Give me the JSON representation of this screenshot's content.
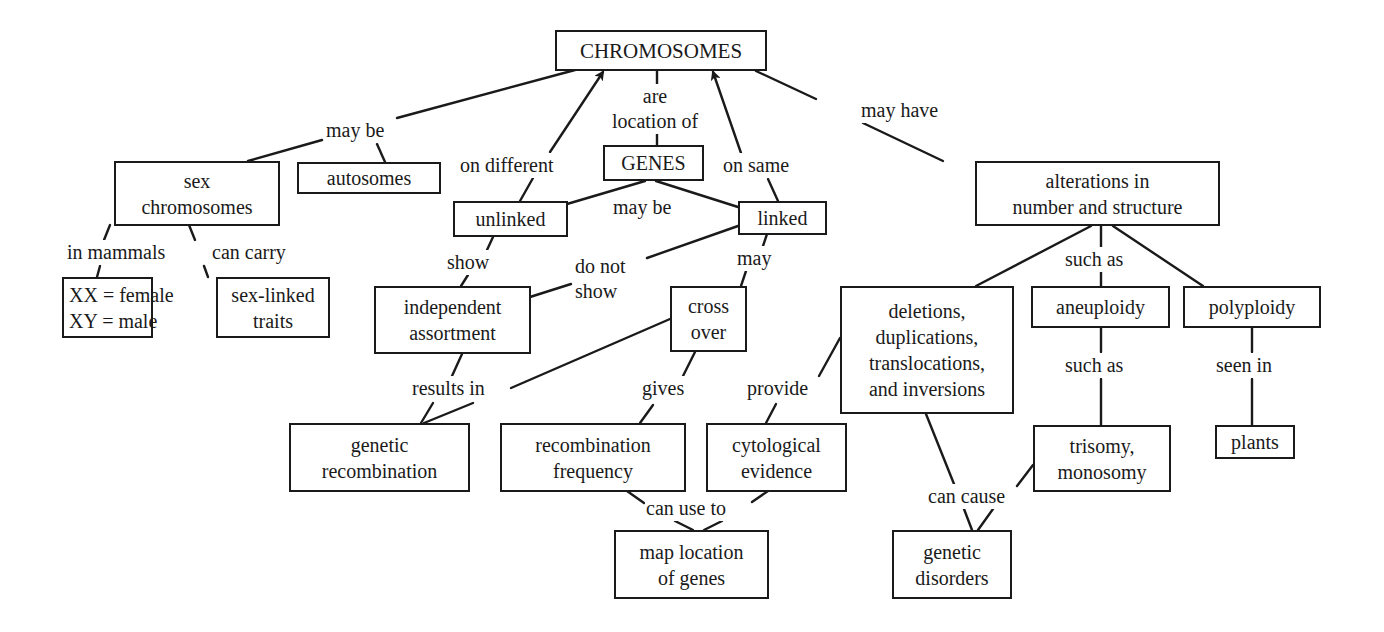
{
  "diagram": {
    "type": "concept-map",
    "root": "CHROMOSOMES",
    "colors": {
      "ink": "#1a1a1a",
      "background": "#ffffff"
    }
  },
  "nodes": {
    "chromosomes": [
      "CHROMOSOMES"
    ],
    "sex_chromosomes": [
      "sex",
      "chromosomes"
    ],
    "autosomes": [
      "autosomes"
    ],
    "xx_xy": [
      "XX = female",
      "XY = male"
    ],
    "sex_linked": [
      "sex-linked",
      "traits"
    ],
    "genes": [
      "GENES"
    ],
    "unlinked": [
      "unlinked"
    ],
    "linked": [
      "linked"
    ],
    "independent": [
      "independent",
      "assortment"
    ],
    "cross_over": [
      "cross",
      "over"
    ],
    "genetic_recombination": [
      "genetic",
      "recombination"
    ],
    "recombination_frequency": [
      "recombination",
      "frequency"
    ],
    "cytological": [
      "cytological",
      "evidence"
    ],
    "map_location": [
      "map location",
      "of genes"
    ],
    "alterations": [
      "alterations in",
      "number and structure"
    ],
    "deletions": [
      "deletions,",
      "duplications,",
      "translocations,",
      "and inversions"
    ],
    "aneuploidy": [
      "aneuploidy"
    ],
    "polyploidy": [
      "polyploidy"
    ],
    "trisomy": [
      "trisomy,",
      "monosomy"
    ],
    "plants": [
      "plants"
    ],
    "genetic_disorders": [
      "genetic",
      "disorders"
    ]
  },
  "labels": {
    "may_be_1": [
      "may be"
    ],
    "are_location_of": [
      "are",
      "location of"
    ],
    "on_different": [
      "on different"
    ],
    "on_same": [
      "on same"
    ],
    "may_have": [
      "may have"
    ],
    "in_mammals": [
      "in mammals"
    ],
    "can_carry": [
      "can carry"
    ],
    "may_be_2": [
      "may be"
    ],
    "show": [
      "show"
    ],
    "do_not_show": [
      "do not",
      "show"
    ],
    "may": [
      "may"
    ],
    "results_in": [
      "results in"
    ],
    "gives": [
      "gives"
    ],
    "provide": [
      "provide"
    ],
    "can_use_to": [
      "can use to"
    ],
    "such_as_1": [
      "such as"
    ],
    "such_as_2": [
      "such as"
    ],
    "seen_in": [
      "seen in"
    ],
    "can_cause": [
      "can cause"
    ]
  },
  "edges": [
    {
      "from": "CHROMOSOMES",
      "label": "may be",
      "to": [
        "sex chromosomes",
        "autosomes"
      ]
    },
    {
      "from": "CHROMOSOMES",
      "label": "are location of",
      "to": [
        "GENES"
      ]
    },
    {
      "from": "unlinked",
      "label": "on different",
      "to": [
        "CHROMOSOMES"
      ],
      "arrow": true
    },
    {
      "from": "linked",
      "label": "on same",
      "to": [
        "CHROMOSOMES"
      ],
      "arrow": true
    },
    {
      "from": "CHROMOSOMES",
      "label": "may have",
      "to": [
        "alterations in number and structure"
      ]
    },
    {
      "from": "sex chromosomes",
      "label": "in mammals",
      "to": [
        "XX = female, XY = male"
      ]
    },
    {
      "from": "sex chromosomes",
      "label": "can carry",
      "to": [
        "sex-linked traits"
      ]
    },
    {
      "from": "GENES",
      "label": "may be",
      "to": [
        "unlinked",
        "linked"
      ]
    },
    {
      "from": "unlinked",
      "label": "show",
      "to": [
        "independent assortment"
      ]
    },
    {
      "from": "linked",
      "label": "do not show",
      "to": [
        "independent assortment"
      ]
    },
    {
      "from": "linked",
      "label": "may",
      "to": [
        "cross over"
      ]
    },
    {
      "from": "independent assortment",
      "label": "results in",
      "to": [
        "genetic recombination"
      ]
    },
    {
      "from": "cross over",
      "label": "results in",
      "to": [
        "genetic recombination"
      ]
    },
    {
      "from": "cross over",
      "label": "gives",
      "to": [
        "recombination frequency"
      ]
    },
    {
      "from": "deletions, duplications, translocations, and inversions",
      "label": "provide",
      "to": [
        "cytological evidence"
      ]
    },
    {
      "from": "recombination frequency",
      "label": "can use to",
      "to": [
        "map location of genes"
      ]
    },
    {
      "from": "cytological evidence",
      "label": "can use to",
      "to": [
        "map location of genes"
      ]
    },
    {
      "from": "alterations in number and structure",
      "label": "such as",
      "to": [
        "deletions, duplications, translocations, and inversions",
        "aneuploidy",
        "polyploidy"
      ]
    },
    {
      "from": "aneuploidy",
      "label": "such as",
      "to": [
        "trisomy, monosomy"
      ]
    },
    {
      "from": "polyploidy",
      "label": "seen in",
      "to": [
        "plants"
      ]
    },
    {
      "from": "deletions, duplications, translocations, and inversions",
      "label": "can cause",
      "to": [
        "genetic disorders"
      ]
    },
    {
      "from": "trisomy, monosomy",
      "label": "can cause",
      "to": [
        "genetic disorders"
      ]
    }
  ]
}
